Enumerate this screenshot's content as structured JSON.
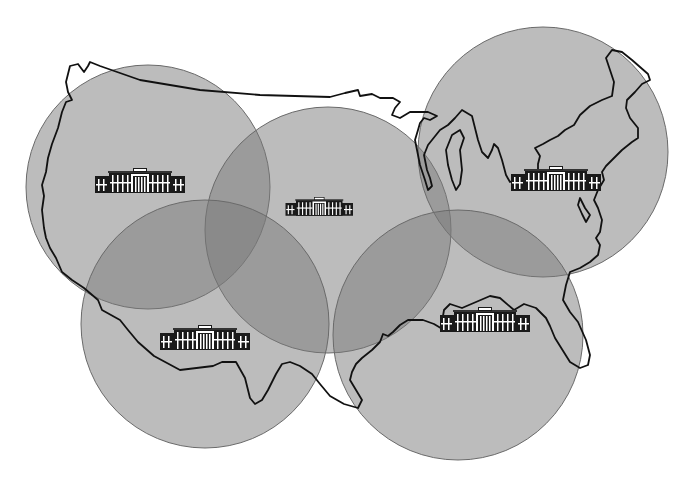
{
  "map": {
    "title": "",
    "description": "Continental United States outline with five overlapping circular coverage regions, each centered on a building icon",
    "colors": {
      "background": "#ffffff",
      "coverage_fill": "#7a7a7a",
      "outline": "#111111",
      "building_dark": "#1a1a1a",
      "building_light": "#ffffff"
    },
    "regions": [
      {
        "name": "northwest",
        "cx": 148,
        "cy": 187,
        "r": 122,
        "icon": "building-icon",
        "icon_x": 95,
        "icon_y": 168
      },
      {
        "name": "central",
        "cx": 328,
        "cy": 230,
        "r": 123,
        "icon": "building-icon",
        "icon_x": 293,
        "icon_y": 197
      },
      {
        "name": "northeast",
        "cx": 543,
        "cy": 152,
        "r": 125,
        "icon": "building-icon",
        "icon_x": 511,
        "icon_y": 166
      },
      {
        "name": "southwest",
        "cx": 205,
        "cy": 324,
        "r": 124,
        "icon": "building-icon",
        "icon_x": 160,
        "icon_y": 325
      },
      {
        "name": "southeast",
        "cx": 458,
        "cy": 335,
        "r": 125,
        "icon": "building-icon",
        "icon_x": 440,
        "icon_y": 307
      }
    ]
  }
}
